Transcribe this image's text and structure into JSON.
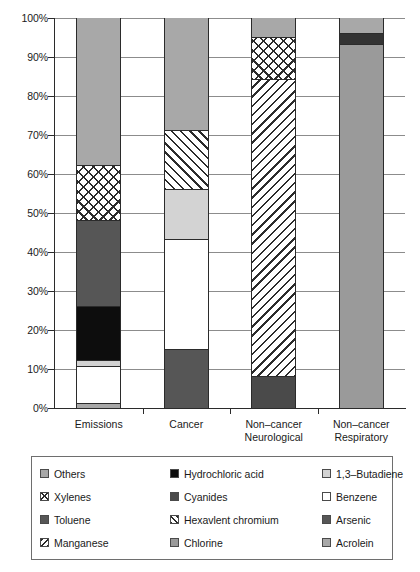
{
  "chart_data": {
    "type": "bar",
    "subtype": "stacked-100-percent",
    "title": "",
    "xlabel": "",
    "ylabel": "",
    "ylim": [
      0,
      100
    ],
    "y_tick_labels": [
      "0%",
      "10%",
      "20%",
      "30%",
      "40%",
      "50%",
      "60%",
      "70%",
      "80%",
      "90%",
      "100%"
    ],
    "y_tick_values": [
      0,
      10,
      20,
      30,
      40,
      50,
      60,
      70,
      80,
      90,
      100
    ],
    "grid": true,
    "legend_position": "below-plot",
    "categories": [
      "Emissions",
      "Cancer",
      "Non–cancer\nNeurological",
      "Non–cancer\nRespiratory"
    ],
    "series": [
      {
        "name": "Others",
        "color": "#a8a8a8",
        "pattern": "solid",
        "values": [
          38.0,
          29.0,
          5.0,
          4.0
        ]
      },
      {
        "name": "Hydrochloric acid",
        "color": "#0d0d0d",
        "pattern": "solid",
        "values": [
          14.0,
          0,
          0,
          0
        ]
      },
      {
        "name": "1,3–Butadiene",
        "color": "#d3d3d3",
        "pattern": "solid",
        "values": [
          1.5,
          13.0,
          0,
          0
        ]
      },
      {
        "name": "Xylenes",
        "color": "#ffffff",
        "pattern": "crosshatch",
        "values": [
          14.0,
          0,
          11.0,
          0
        ]
      },
      {
        "name": "Cyanides",
        "color": "#4a4a4a",
        "pattern": "solid",
        "values": [
          0,
          0,
          8.0,
          0
        ]
      },
      {
        "name": "Benzene",
        "color": "#ffffff",
        "pattern": "solid",
        "values": [
          9.5,
          28.0,
          0,
          0
        ]
      },
      {
        "name": "Toluene",
        "color": "#565656",
        "pattern": "solid",
        "values": [
          22.0,
          0,
          0,
          0
        ]
      },
      {
        "name": "Hexavlent chromium",
        "color": "#ffffff",
        "pattern": "hatch-fwd",
        "values": [
          0,
          15.0,
          0,
          0
        ]
      },
      {
        "name": "Arsenic",
        "color": "#565656",
        "pattern": "solid",
        "values": [
          0,
          15.0,
          0,
          0
        ]
      },
      {
        "name": "Manganese",
        "color": "#ffffff",
        "pattern": "hatch-back",
        "values": [
          0,
          0,
          76.0,
          0
        ]
      },
      {
        "name": "Chlorine",
        "color": "#9a9a9a",
        "pattern": "solid",
        "values": [
          0,
          0,
          0,
          93.0
        ]
      },
      {
        "name": "Acrolein",
        "color": "#a8a8a8",
        "pattern": "solid",
        "values": [
          1.0,
          0,
          0,
          3.0
        ]
      }
    ],
    "stacks": [
      {
        "category": "Emissions",
        "segments": [
          {
            "label": "Acrolein",
            "from": 0,
            "to": 1.0,
            "fill": "f-gray"
          },
          {
            "label": "Benzene",
            "from": 1.0,
            "to": 10.5,
            "fill": "f-white"
          },
          {
            "label": "1,3–Butadiene",
            "from": 10.5,
            "to": 12.0,
            "fill": "f-lightgray"
          },
          {
            "label": "Hydrochloric acid",
            "from": 12.0,
            "to": 26.0,
            "fill": "f-black"
          },
          {
            "label": "Toluene",
            "from": 26.0,
            "to": 48.0,
            "fill": "f-darkgray"
          },
          {
            "label": "Xylenes",
            "from": 48.0,
            "to": 62.0,
            "fill": "f-cross"
          },
          {
            "label": "Others",
            "from": 62.0,
            "to": 100,
            "fill": "f-gray"
          }
        ]
      },
      {
        "category": "Cancer",
        "segments": [
          {
            "label": "Arsenic",
            "from": 0,
            "to": 15.0,
            "fill": "f-darkgray"
          },
          {
            "label": "Benzene",
            "from": 15.0,
            "to": 43.0,
            "fill": "f-white"
          },
          {
            "label": "1,3–Butadiene",
            "from": 43.0,
            "to": 56.0,
            "fill": "f-lightgray"
          },
          {
            "label": "Hexavlent chromium",
            "from": 56.0,
            "to": 71.0,
            "fill": "f-hatch-fwd"
          },
          {
            "label": "Others",
            "from": 71.0,
            "to": 100,
            "fill": "f-gray"
          }
        ]
      },
      {
        "category": "Non–cancer Neurological",
        "segments": [
          {
            "label": "Cyanides",
            "from": 0,
            "to": 8.0,
            "fill": "f-darker"
          },
          {
            "label": "Manganese",
            "from": 8.0,
            "to": 84.0,
            "fill": "f-hatch-back"
          },
          {
            "label": "Xylenes",
            "from": 84.0,
            "to": 95.0,
            "fill": "f-cross"
          },
          {
            "label": "Others",
            "from": 95.0,
            "to": 100,
            "fill": "f-gray"
          }
        ]
      },
      {
        "category": "Non–cancer Respiratory",
        "segments": [
          {
            "label": "Chlorine",
            "from": 0,
            "to": 93.0,
            "fill": "f-midgray"
          },
          {
            "label": "Hydrochloric acid",
            "from": 93.0,
            "to": 96.0,
            "fill": "f-neardark"
          },
          {
            "label": "Others",
            "from": 96.0,
            "to": 100,
            "fill": "f-gray"
          }
        ]
      }
    ]
  },
  "axis": {
    "y_labels": [
      "100%",
      "90%",
      "80%",
      "70%",
      "60%",
      "50%",
      "40%",
      "30%",
      "20%",
      "10%",
      "0%"
    ],
    "x_labels": [
      {
        "line1": "Emissions",
        "line2": ""
      },
      {
        "line1": "Cancer",
        "line2": ""
      },
      {
        "line1": "Non–cancer",
        "line2": "Neurological"
      },
      {
        "line1": "Non–cancer",
        "line2": "Respiratory"
      }
    ]
  },
  "legend": {
    "items": [
      {
        "label": "Others",
        "fill": "f-gray",
        "icon": "legend-swatch-solid-gray"
      },
      {
        "label": "Hydrochloric acid",
        "fill": "f-black",
        "icon": "legend-swatch-solid-black"
      },
      {
        "label": "1,3–Butadiene",
        "fill": "f-lightgray",
        "icon": "legend-swatch-solid-light-gray"
      },
      {
        "label": "Xylenes",
        "fill": "f-cross",
        "icon": "legend-swatch-crosshatch"
      },
      {
        "label": "Cyanides",
        "fill": "f-darker",
        "icon": "legend-swatch-solid-dark-gray"
      },
      {
        "label": "Benzene",
        "fill": "f-white",
        "icon": "legend-swatch-solid-white"
      },
      {
        "label": "Toluene",
        "fill": "f-darkgray",
        "icon": "legend-swatch-solid-dark-gray"
      },
      {
        "label": "Hexavlent chromium",
        "fill": "f-hatch-fwd",
        "icon": "legend-swatch-diagonal-hatch-forward"
      },
      {
        "label": "Arsenic",
        "fill": "f-darkgray",
        "icon": "legend-swatch-solid-dark-gray"
      },
      {
        "label": "Manganese",
        "fill": "f-hatch-back",
        "icon": "legend-swatch-diagonal-hatch-back"
      },
      {
        "label": "Chlorine",
        "fill": "f-midgray",
        "icon": "legend-swatch-solid-mid-gray"
      },
      {
        "label": "Acrolein",
        "fill": "f-gray",
        "icon": "legend-swatch-solid-gray"
      }
    ]
  }
}
